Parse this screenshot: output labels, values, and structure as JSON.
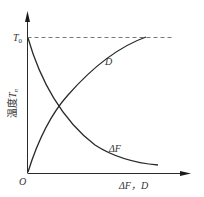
{
  "diagram": {
    "type": "curve-plot",
    "y_axis": {
      "label_prefix": "温度",
      "label_var": "T",
      "label_sub": "n"
    },
    "x_axis": {
      "label": "ΔF，D"
    },
    "origin_label": "O",
    "reference_line": {
      "label_var": "T",
      "label_sub": "0",
      "style": "dashed"
    },
    "curves": [
      {
        "name": "ΔF",
        "label": "ΔF",
        "shape": "decreasing, convex",
        "from": "T0 at y-axis",
        "to": "approaches x-axis"
      },
      {
        "name": "D",
        "label": "D",
        "shape": "increasing, concave",
        "from": "origin",
        "to": "T0 line"
      }
    ],
    "colors": {
      "line": "#2a2a2a",
      "text": "#333333",
      "dashed": "#555555"
    }
  }
}
